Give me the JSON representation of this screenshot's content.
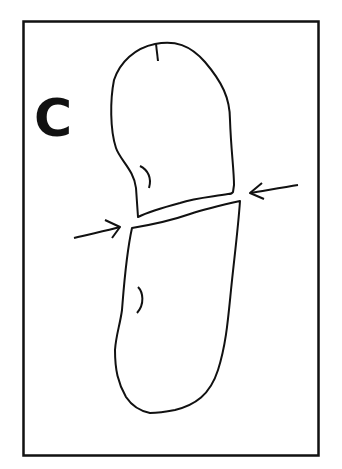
{
  "panel": {
    "label": "C"
  },
  "colors": {
    "stroke": "#111111",
    "background": "#ffffff"
  },
  "diagram": {
    "elements": [
      "frame",
      "upper-cell",
      "lower-cell",
      "septum",
      "left-arrow",
      "right-arrow",
      "upper-cell-mark",
      "lower-cell-mark",
      "pole-mark"
    ]
  }
}
